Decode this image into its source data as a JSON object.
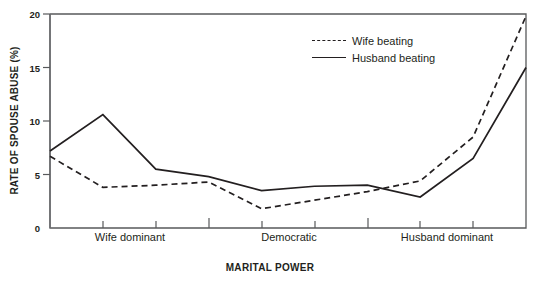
{
  "chart_data": {
    "type": "line",
    "title": "",
    "xlabel": "MARITAL POWER",
    "ylabel": "RATE OF SPOUSE ABUSE (%)",
    "ylim": [
      0,
      20
    ],
    "yticks": [
      0,
      5,
      10,
      15,
      20
    ],
    "ytick_labels": [
      "0",
      "5",
      "10",
      "15",
      "20"
    ],
    "grid": false,
    "legend_position": "top-right",
    "x": [
      0,
      1,
      2,
      3,
      4,
      5,
      6,
      7,
      8,
      9
    ],
    "categories": [
      "",
      "Wife dominant",
      "",
      "",
      "Democratic",
      "",
      "",
      "Husband dominant",
      "",
      ""
    ],
    "xtick_labels": [
      "Wife dominant",
      "Democratic",
      "Husband dominant"
    ],
    "xtick_positions": [
      1,
      4,
      7
    ],
    "series": [
      {
        "name": "Wife beating",
        "style": "dashed",
        "color": "#231f20",
        "values": [
          6.7,
          3.8,
          4.0,
          4.3,
          1.8,
          2.6,
          3.4,
          4.4,
          8.5,
          19.8
        ]
      },
      {
        "name": "Husband beating",
        "style": "solid",
        "color": "#231f20",
        "values": [
          7.2,
          10.6,
          5.5,
          4.8,
          3.5,
          3.9,
          4.0,
          2.9,
          6.5,
          15.0
        ]
      }
    ]
  },
  "axis": {
    "y_label": "RATE OF SPOUSE ABUSE (%)",
    "x_title": "MARITAL POWER",
    "ticks": {
      "y": [
        "20",
        "15",
        "10",
        "5",
        "0"
      ],
      "x": [
        "Wife dominant",
        "Democratic",
        "Husband dominant"
      ]
    }
  },
  "legend": {
    "items": [
      {
        "label": "Wife beating",
        "dash": true
      },
      {
        "label": "Husband beating",
        "dash": false
      }
    ]
  }
}
